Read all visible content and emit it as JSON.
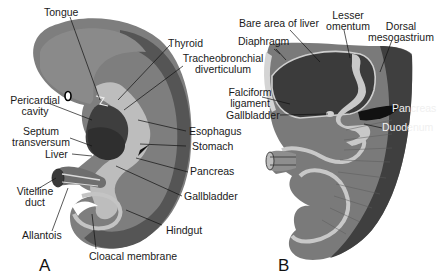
{
  "figure": {
    "panel_a": {
      "letter": "A",
      "labels": {
        "tongue": "Tongue",
        "thyroid": "Thyroid",
        "tracheobronchial_1": "Tracheobronchial",
        "tracheobronchial_2": "diverticulum",
        "pericardial_1": "Pericardial",
        "pericardial_2": "cavity",
        "septum_1": "Septum",
        "septum_2": "transversum",
        "esophagus": "Esophagus",
        "stomach": "Stomach",
        "liver": "Liver",
        "pancreas": "Pancreas",
        "vitelline_1": "Vitelline",
        "vitelline_2": "duct",
        "gallbladder": "Gallbladder",
        "hindgut": "Hindgut",
        "allantois": "Allantois",
        "cloacal": "Cloacal membrane"
      }
    },
    "panel_b": {
      "letter": "B",
      "labels": {
        "bare_area": "Bare area of liver",
        "lesser_1": "Lesser",
        "lesser_2": "omentum",
        "dorsal_1": "Dorsal",
        "dorsal_2": "mesogastrium",
        "diaphragm": "Diaphragm",
        "falciform_1": "Falciform",
        "falciform_2": "ligament",
        "gallbladder": "Gallbladder",
        "pancreas": "Pancreas",
        "duodenum": "Duodenum"
      }
    },
    "signature": "ahK"
  }
}
